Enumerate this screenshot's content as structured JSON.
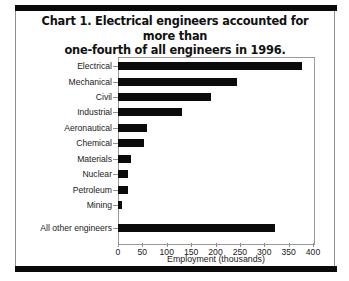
{
  "chart_data": {
    "type": "bar",
    "orientation": "horizontal",
    "title": "Chart 1. Electrical engineers accounted for more than one-fourth of all engineers in 1996.",
    "title_line1": "Chart 1. Electrical engineers accounted for more than",
    "title_line2": "one-fourth of all engineers in 1996.",
    "xlabel": "Employment (thousands)",
    "ylabel": "",
    "xlim": [
      0,
      400
    ],
    "xticks": [
      0,
      50,
      100,
      150,
      200,
      250,
      300,
      350,
      400
    ],
    "xtick_labels": [
      "0",
      "50",
      "100",
      "150",
      "200",
      "250",
      "300",
      "350",
      "400"
    ],
    "grid": false,
    "legend": false,
    "bar_color": "#0b0b0b",
    "categories": [
      "Electrical",
      "Mechanical",
      "Civil",
      "Industrial",
      "Aeronautical",
      "Chemical",
      "Materials",
      "Nuclear",
      "Petroleum",
      "Mining",
      "All other engineers"
    ],
    "values": [
      377,
      244,
      190,
      132,
      60,
      53,
      27,
      21,
      21,
      9,
      322
    ]
  }
}
